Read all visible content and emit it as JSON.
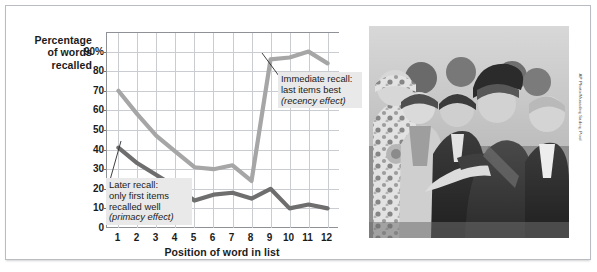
{
  "figure": {
    "background_color": "#ffffff",
    "border_color": "#b9bcc0"
  },
  "chart_data": {
    "type": "line",
    "title": "",
    "xlabel": "Position of word in list",
    "ylabel": "Percentage of words recalled",
    "x": [
      1,
      2,
      3,
      4,
      5,
      6,
      7,
      8,
      9,
      10,
      11,
      12
    ],
    "xtick_labels": [
      "1",
      "2",
      "3",
      "4",
      "5",
      "6",
      "7",
      "8",
      "9",
      "10",
      "11",
      "12"
    ],
    "ytick_labels": [
      "0",
      "10",
      "20",
      "30",
      "40",
      "50",
      "60",
      "70",
      "80",
      "90%"
    ],
    "yticks": [
      0,
      10,
      20,
      30,
      40,
      50,
      60,
      70,
      80,
      90
    ],
    "ylim": [
      0,
      100
    ],
    "xlim": [
      0.4,
      12.6
    ],
    "grid": true,
    "legend_position": "none",
    "series": [
      {
        "name": "Immediate recall",
        "color": "#a6a6a6",
        "values": [
          70,
          58,
          47,
          39,
          31,
          30,
          32,
          24,
          86,
          87,
          90,
          84
        ]
      },
      {
        "name": "Later recall",
        "color": "#6e6e6e",
        "values": [
          41,
          33,
          27,
          21,
          14,
          17,
          18,
          15,
          20,
          10,
          12,
          10
        ]
      }
    ],
    "annotations": [
      {
        "name": "immediate-recall-callout",
        "line1": "Immediate recall:",
        "line2": "last items best",
        "line3": "(recency effect)",
        "background": "#e9e9e9"
      },
      {
        "name": "later-recall-callout",
        "line1": "Later recall:",
        "line2": "only first items",
        "line3": "recalled well",
        "line4": "(primacy effect)",
        "background": "#e9e9e9"
      }
    ]
  },
  "y_axis_title": {
    "line1": "Percentage",
    "line2": "of words",
    "line3": "recalled"
  },
  "photo": {
    "alt": "black-and-white photograph of Hamid Karzai greeting a line of officials and soldiers",
    "credit": "AP Photo/Musadeq Sadeq, Pool"
  }
}
